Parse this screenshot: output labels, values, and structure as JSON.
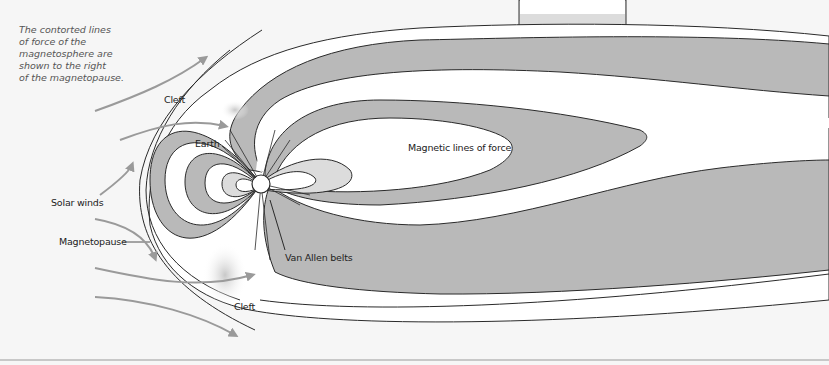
{
  "caption": "The contorted lines\nof force of the\nmagnetosphere are\nshown to the right\nof the magnetopause.",
  "labels": {
    "cleft_top": "Cleft",
    "earth": "Earth",
    "magnetic_lines": "Magnetic lines of force",
    "solar_winds": "Solar winds",
    "magnetopause": "Magnetopause",
    "van_allen": "Van Allen belts",
    "cleft_bottom": "Cleft"
  },
  "colors": {
    "background": "#f6f6f6",
    "band_gray": "#b9b9b9",
    "band_light": "#dcdcdc",
    "white": "#ffffff",
    "line": "#2a2a2a",
    "arrow": "#9a9a9a"
  }
}
